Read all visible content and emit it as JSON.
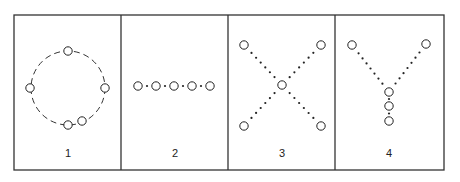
{
  "figure": {
    "frame": {
      "x": 14,
      "y": 15,
      "width": 430,
      "height": 155,
      "stroke": "#333333"
    },
    "dividers_x": [
      121,
      228,
      335
    ],
    "panels": [
      {
        "label": "1",
        "label_pos": [
          68,
          157
        ],
        "connection_style": "dashed",
        "description": "five nodes arranged on a dashed ring",
        "ring": {
          "cx": 68,
          "cy": 88,
          "r": 37
        },
        "nodes": [
          [
            68,
            51
          ],
          [
            30,
            88
          ],
          [
            105,
            88
          ],
          [
            68,
            125
          ],
          [
            82,
            121
          ]
        ]
      },
      {
        "label": "2",
        "label_pos": [
          175,
          157
        ],
        "connection_style": "dotted",
        "description": "five nodes in a horizontal chain",
        "nodes": [
          [
            138,
            86
          ],
          [
            156,
            86
          ],
          [
            174,
            86
          ],
          [
            192,
            86
          ],
          [
            210,
            86
          ]
        ]
      },
      {
        "label": "3",
        "label_pos": [
          282,
          157
        ],
        "connection_style": "dotted",
        "description": "four outer nodes joined to a central hub (X / star)",
        "nodes": [
          [
            244,
            45
          ],
          [
            321,
            45
          ],
          [
            282,
            85
          ],
          [
            244,
            126
          ],
          [
            321,
            126
          ]
        ],
        "edges": [
          [
            0,
            2
          ],
          [
            1,
            2
          ],
          [
            3,
            2
          ],
          [
            4,
            2
          ]
        ]
      },
      {
        "label": "4",
        "label_pos": [
          389,
          157
        ],
        "connection_style": "dotted",
        "description": "Y shape: two arms converging into a vertical chain of three nodes",
        "nodes": [
          [
            352,
            45
          ],
          [
            426,
            44
          ],
          [
            389,
            92
          ],
          [
            389,
            106
          ],
          [
            389,
            121
          ]
        ],
        "edges": [
          [
            0,
            2
          ],
          [
            1,
            2
          ],
          [
            2,
            3
          ],
          [
            3,
            4
          ]
        ]
      }
    ]
  }
}
